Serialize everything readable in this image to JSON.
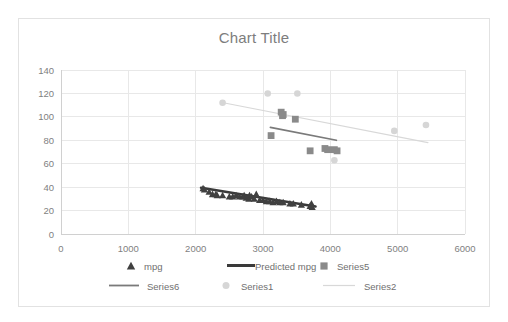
{
  "chart_data": {
    "type": "scatter",
    "title": "Chart Title",
    "xlabel": "",
    "ylabel": "",
    "xlim": [
      0,
      6000
    ],
    "ylim": [
      0,
      140
    ],
    "xticks": [
      0,
      1000,
      2000,
      3000,
      4000,
      5000,
      6000
    ],
    "yticks": [
      0,
      20,
      40,
      60,
      80,
      100,
      120,
      140
    ],
    "grid": true,
    "legend_position": "bottom",
    "series": [
      {
        "name": "mpg",
        "marker": "triangle",
        "color": "#404040",
        "points": [
          [
            2110,
            39
          ],
          [
            2130,
            38
          ],
          [
            2200,
            36
          ],
          [
            2250,
            34
          ],
          [
            2300,
            34
          ],
          [
            2320,
            33
          ],
          [
            2400,
            33
          ],
          [
            2500,
            32
          ],
          [
            2550,
            32
          ],
          [
            2600,
            33
          ],
          [
            2650,
            32
          ],
          [
            2700,
            32
          ],
          [
            2720,
            33
          ],
          [
            2750,
            31
          ],
          [
            2790,
            30
          ],
          [
            2800,
            33
          ],
          [
            2830,
            32
          ],
          [
            2870,
            30
          ],
          [
            2900,
            34
          ],
          [
            2950,
            29
          ],
          [
            3000,
            29
          ],
          [
            3050,
            28
          ],
          [
            3100,
            28
          ],
          [
            3150,
            27
          ],
          [
            3200,
            28
          ],
          [
            3250,
            27
          ],
          [
            3300,
            27
          ],
          [
            3400,
            26
          ],
          [
            3450,
            26
          ],
          [
            3570,
            25
          ],
          [
            3700,
            24
          ],
          [
            3720,
            26
          ],
          [
            3730,
            23
          ]
        ]
      },
      {
        "name": "Predicted mpg",
        "marker": "line",
        "color": "#3a3a3a",
        "line_from": [
          2080,
          39.5
        ],
        "line_to": [
          3780,
          23.5
        ]
      },
      {
        "name": "Series5",
        "marker": "square",
        "color": "#8a8a8a",
        "points": [
          [
            3120,
            84
          ],
          [
            3270,
            104
          ],
          [
            3290,
            101
          ],
          [
            3300,
            102
          ],
          [
            3480,
            98
          ],
          [
            3700,
            71
          ],
          [
            3920,
            73
          ],
          [
            3960,
            72
          ],
          [
            4060,
            72
          ],
          [
            4100,
            71
          ]
        ]
      },
      {
        "name": "Series6",
        "marker": "line",
        "color": "#7a7a7a",
        "line_from": [
          3110,
          91
        ],
        "line_to": [
          4090,
          80
        ]
      },
      {
        "name": "Series1",
        "marker": "circle",
        "color": "#d6d6d6",
        "points": [
          [
            2400,
            112
          ],
          [
            3070,
            120
          ],
          [
            3510,
            120
          ],
          [
            4060,
            63
          ],
          [
            4950,
            88
          ],
          [
            5420,
            93
          ]
        ]
      },
      {
        "name": "Series2",
        "marker": "line",
        "color": "#d8d8d8",
        "line_from": [
          2410,
          112
        ],
        "line_to": [
          5450,
          78
        ]
      }
    ]
  },
  "legend": {
    "items": [
      {
        "label": "mpg",
        "marker": "triangle",
        "color": "#404040"
      },
      {
        "label": "Predicted mpg",
        "marker": "thick-line",
        "color": "#3a3a3a"
      },
      {
        "label": "Series5",
        "marker": "square",
        "color": "#8a8a8a"
      },
      {
        "label": "Series6",
        "marker": "line",
        "color": "#7a7a7a"
      },
      {
        "label": "Series1",
        "marker": "circle",
        "color": "#d6d6d6"
      },
      {
        "label": "Series2",
        "marker": "thin-line",
        "color": "#d8d8d8"
      }
    ]
  },
  "colors": {
    "frame_border": "#e2e2e2",
    "gridline": "#e8e8e8",
    "axis": "#d0d0d0",
    "tick_text": "#7f7f7f",
    "title_text": "#7d7d7d",
    "legend_text": "#6f6f6f",
    "background": "#ffffff"
  }
}
